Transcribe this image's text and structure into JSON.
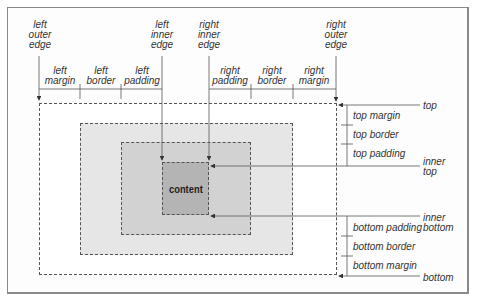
{
  "diagram": {
    "type": "css-box-model",
    "content_label": "content",
    "colors": {
      "margin_area": "#ffffff",
      "border_area": "#e6e6e6",
      "padding_area": "#d2d2d2",
      "content_area": "#b4b4b4",
      "lines": "#555555",
      "frame": "#8a8a8a"
    },
    "vertical_edge_labels": {
      "left_outer_edge": [
        "left",
        "outer",
        "edge"
      ],
      "left_inner_edge": [
        "left",
        "inner",
        "edge"
      ],
      "right_inner_edge": [
        "right",
        "inner",
        "edge"
      ],
      "right_outer_edge": [
        "right",
        "outer",
        "edge"
      ]
    },
    "horizontal_segments": {
      "left_margin": [
        "left",
        "margin"
      ],
      "left_border": [
        "left",
        "border"
      ],
      "left_padding": [
        "left",
        "padding"
      ],
      "right_padding": [
        "right",
        "padding"
      ],
      "right_border": [
        "right",
        "border"
      ],
      "right_margin": [
        "right",
        "margin"
      ]
    },
    "right_side_edges": {
      "top": "top",
      "inner_top": [
        "inner",
        "top"
      ],
      "inner_bottom": [
        "inner",
        "bottom"
      ],
      "bottom": "bottom"
    },
    "vertical_segments": {
      "top_margin": "top margin",
      "top_border": "top border",
      "top_padding": "top padding",
      "bottom_padding": "bottom padding",
      "bottom_border": "bottom border",
      "bottom_margin": "bottom margin"
    }
  }
}
